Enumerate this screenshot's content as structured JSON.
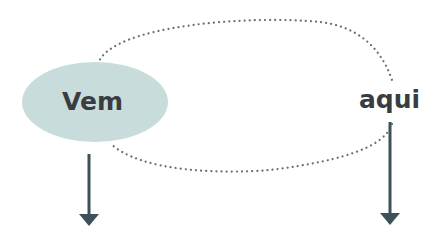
{
  "diagram": {
    "nodes": [
      {
        "id": "vem",
        "label": "Vem",
        "shape": "ellipse",
        "fill": "#c9dcdc"
      },
      {
        "id": "aqui",
        "label": "aqui",
        "shape": "text"
      }
    ],
    "connector": {
      "style": "dotted",
      "shape": "loop",
      "color": "#6b6e72"
    },
    "arrows": [
      {
        "from": "vem",
        "direction": "down",
        "color": "#3c5158"
      },
      {
        "from": "aqui",
        "direction": "down",
        "color": "#3c5158"
      }
    ]
  }
}
